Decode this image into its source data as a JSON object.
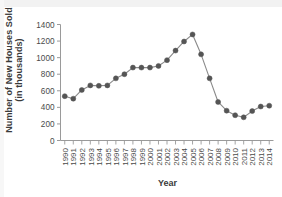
{
  "chart_data": {
    "type": "line",
    "title": "",
    "xlabel": "Year",
    "ylabel_line1": "Number of New Houses Sold",
    "ylabel_line2": "(in thousands)",
    "categories": [
      "1990",
      "1991",
      "1992",
      "1993",
      "1994",
      "1995",
      "1996",
      "1997",
      "1998",
      "1999",
      "2000",
      "2001",
      "2002",
      "2003",
      "2004",
      "2005",
      "2006",
      "2007",
      "2008",
      "2009",
      "2010",
      "2011",
      "2012",
      "2013",
      "2014"
    ],
    "values": [
      535,
      505,
      610,
      665,
      660,
      665,
      750,
      800,
      880,
      880,
      880,
      900,
      970,
      1085,
      1195,
      1280,
      1040,
      750,
      465,
      360,
      305,
      280,
      355,
      410,
      420
    ],
    "ylim": [
      0,
      1400
    ],
    "ytick_labels": [
      "0",
      "200",
      "400",
      "600",
      "800",
      "1000",
      "1200",
      "1400"
    ],
    "ytick_values": [
      0,
      200,
      400,
      600,
      800,
      1000,
      1200,
      1400
    ],
    "grid": false,
    "legend": "none",
    "marker": "circle",
    "marker_color": "#555555",
    "line_color": "#8a8a8a",
    "axis_color": "#9a9a9a"
  }
}
